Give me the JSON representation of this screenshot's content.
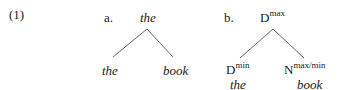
{
  "example": {
    "number": "(1)"
  },
  "tree_a": {
    "label": "a.",
    "root": "the",
    "leaves": [
      {
        "word": "the"
      },
      {
        "word": "book"
      }
    ]
  },
  "tree_b": {
    "label": "b.",
    "root": {
      "category": "D",
      "superscript": "max"
    },
    "leaves": [
      {
        "category": "D",
        "superscript": "min",
        "word": "the"
      },
      {
        "category": "N",
        "superscript": "max/min",
        "word": "book"
      }
    ]
  },
  "colors": {
    "text": "#1a1a1a",
    "branch": "#555555",
    "background": "#ffffff"
  }
}
